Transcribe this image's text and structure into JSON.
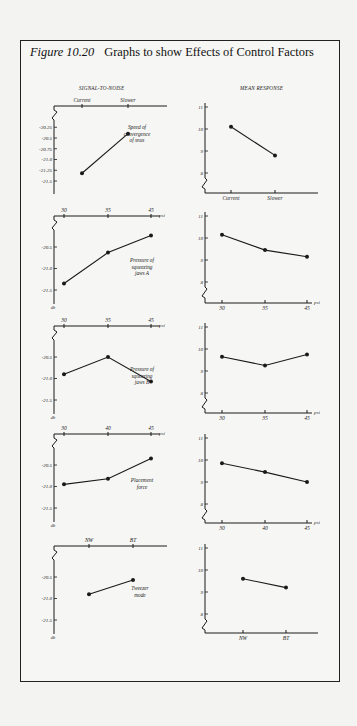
{
  "figure": {
    "label": "Figure 10.20",
    "title": "Graphs to show Effects of Control Factors"
  },
  "columns": {
    "left": "SIGNAL-TO-NOISE",
    "right": "MEAN RESPONSE"
  },
  "chart_data": [
    {
      "type": "line",
      "panel": "signal-to-noise",
      "factor": "Speed of convergence of snus",
      "categories": [
        "Current",
        "Slower"
      ],
      "values": [
        -21.32,
        -20.4
      ],
      "yticks": [
        "-20.25",
        "-20.5",
        "-20.75",
        "-21.0",
        "-21.25",
        "-21.5"
      ],
      "ylim": [
        -21.6,
        -20.1
      ],
      "ylabel": "",
      "xunit": ""
    },
    {
      "type": "line",
      "panel": "mean-response",
      "factor": "Speed of convergence of snus",
      "categories": [
        "Current",
        "Slower"
      ],
      "values": [
        10.1,
        8.8
      ],
      "yticks": [
        "11",
        "10",
        "9",
        "8"
      ],
      "ylim": [
        7.5,
        11.1
      ],
      "xunit": ""
    },
    {
      "type": "line",
      "panel": "signal-to-noise",
      "factor": "Pressure of squeezing jaws A",
      "categories": [
        "30",
        "35",
        "45"
      ],
      "values": [
        -21.35,
        -20.63,
        -20.23
      ],
      "yticks": [
        "-20.5",
        "-21.0",
        "-21.5"
      ],
      "ylim": [
        -21.6,
        -20.1
      ],
      "ylabel": "db",
      "xunit": "psi"
    },
    {
      "type": "line",
      "panel": "mean-response",
      "factor": "Pressure of squeezing jaws A",
      "categories": [
        "30",
        "35",
        "45"
      ],
      "values": [
        10.15,
        9.45,
        9.15
      ],
      "yticks": [
        "11",
        "10",
        "9",
        "8"
      ],
      "ylim": [
        7.5,
        11.1
      ],
      "xunit": "psi"
    },
    {
      "type": "line",
      "panel": "signal-to-noise",
      "factor": "Pressure of squeezing jaws B",
      "categories": [
        "30",
        "35",
        "45"
      ],
      "values": [
        -20.9,
        -20.5,
        -21.07
      ],
      "yticks": [
        "-20.5",
        "-21.0",
        "-21.5"
      ],
      "ylim": [
        -21.6,
        -20.1
      ],
      "ylabel": "db",
      "xunit": "psi"
    },
    {
      "type": "line",
      "panel": "mean-response",
      "factor": "Pressure of squeezing jaws B",
      "categories": [
        "30",
        "35",
        "45"
      ],
      "values": [
        9.65,
        9.25,
        9.75
      ],
      "yticks": [
        "11",
        "10",
        "9",
        "8"
      ],
      "ylim": [
        7.5,
        11.1
      ],
      "xunit": "psi"
    },
    {
      "type": "line",
      "panel": "signal-to-noise",
      "factor": "Placement force",
      "categories": [
        "30",
        "40",
        "45"
      ],
      "values": [
        -20.95,
        -20.82,
        -20.35
      ],
      "yticks": [
        "-20.5",
        "-21.0",
        "-21.5"
      ],
      "ylim": [
        -21.6,
        -20.1
      ],
      "ylabel": "db",
      "xunit": "psi"
    },
    {
      "type": "line",
      "panel": "mean-response",
      "factor": "Placement force",
      "categories": [
        "30",
        "40",
        "45"
      ],
      "values": [
        9.85,
        9.45,
        9.0
      ],
      "yticks": [
        "11",
        "10",
        "9",
        "8"
      ],
      "ylim": [
        7.5,
        11.1
      ],
      "xunit": "psi"
    },
    {
      "type": "line",
      "panel": "signal-to-noise",
      "factor": "Tweezer mode",
      "categories": [
        "NW",
        "BT"
      ],
      "values": [
        -20.9,
        -20.57
      ],
      "yticks": [
        "-20.5",
        "-21.0",
        "-21.5"
      ],
      "ylim": [
        -21.6,
        -20.1
      ],
      "ylabel": "db",
      "xunit": ""
    },
    {
      "type": "line",
      "panel": "mean-response",
      "factor": "Tweezer mode",
      "categories": [
        "NW",
        "BT"
      ],
      "values": [
        9.6,
        9.2
      ],
      "yticks": [
        "11",
        "10",
        "9",
        "8"
      ],
      "ylim": [
        7.5,
        11.1
      ],
      "xunit": ""
    }
  ],
  "labels": {
    "f1": [
      "Speed of",
      "convergence",
      "of snus"
    ],
    "f2": [
      "Pressure of",
      "squeezing",
      "jaws A"
    ],
    "f3": [
      "Pressure of",
      "squeezing",
      "jaws B"
    ],
    "f4": [
      "Placement",
      "force"
    ],
    "f5": [
      "Tweezer",
      "mode"
    ]
  },
  "style": {
    "ink": "#1a1a1a",
    "paper": "#f6f6f4"
  }
}
